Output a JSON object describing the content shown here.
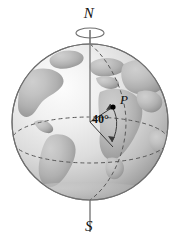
{
  "figure": {
    "background_color": "#ffffff",
    "width": 178,
    "height": 240
  },
  "labels": {
    "north_pole": "N",
    "south_pole": "S",
    "point": "P",
    "angle": "40°"
  },
  "colors": {
    "background": "#ffffff",
    "ocean_light": "#f2f2f2",
    "ocean_mid": "#d8d8d8",
    "ocean_dark": "#a8a8a8",
    "land": "#b4b4b4",
    "land_dark": "#9a9a9a",
    "outline": "#6e6e6e",
    "axis": "#8a8a8a",
    "guide": "#4a4a4a",
    "text": "#111111",
    "point_marker": "#000000"
  },
  "geometry": {
    "sphere_center_x": 90,
    "sphere_center_y": 122,
    "sphere_radius": 78,
    "axis_top_y": 30,
    "axis_bottom_y": 232,
    "rotation_ellipse_y": 33,
    "point_p_x": 113,
    "point_p_y": 107,
    "latitude_degrees": 40
  },
  "elements": {
    "rotation_indicator": "rotation-ellipse",
    "equator": "equator-dashed-ellipse",
    "meridian": "meridian-dashed-arc",
    "angle_arc": "angle-arc-40",
    "radius_to_equator": "radius-line-equator",
    "radius_to_point": "radius-line-point-p"
  }
}
